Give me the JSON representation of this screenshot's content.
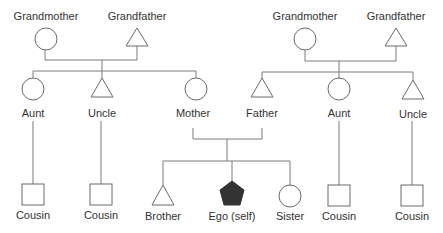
{
  "diagram": {
    "type": "kinship-chart",
    "colors": {
      "line": "#7a7a7a",
      "ego_fill": "#333333",
      "text": "#333333"
    },
    "maternal": {
      "grandmother": {
        "label": "Grandmother",
        "symbol": "circle"
      },
      "grandfather": {
        "label": "Grandfather",
        "symbol": "triangle"
      },
      "aunt": {
        "label": "Aunt",
        "symbol": "circle"
      },
      "uncle": {
        "label": "Uncle",
        "symbol": "triangle"
      },
      "mother": {
        "label": "Mother",
        "symbol": "circle"
      },
      "cousin_via_aunt": {
        "label": "Cousin",
        "symbol": "square"
      },
      "cousin_via_uncle": {
        "label": "Cousin",
        "symbol": "square"
      }
    },
    "paternal": {
      "grandmother": {
        "label": "Grandmother",
        "symbol": "circle"
      },
      "grandfather": {
        "label": "Grandfather",
        "symbol": "triangle"
      },
      "father": {
        "label": "Father",
        "symbol": "triangle"
      },
      "aunt": {
        "label": "Aunt",
        "symbol": "circle"
      },
      "uncle": {
        "label": "Uncle",
        "symbol": "triangle"
      },
      "cousin_via_aunt": {
        "label": "Cousin",
        "symbol": "square"
      },
      "cousin_via_uncle": {
        "label": "Cousin",
        "symbol": "square"
      }
    },
    "nuclear": {
      "brother": {
        "label": "Brother",
        "symbol": "triangle"
      },
      "ego": {
        "label": "Ego (self)",
        "symbol": "pentagon-filled"
      },
      "sister": {
        "label": "Sister",
        "symbol": "circle"
      }
    }
  }
}
